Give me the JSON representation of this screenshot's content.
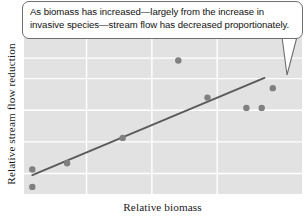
{
  "figure": {
    "callout": {
      "text": "As biomass has increased—largely from the increase in invasive species—stream flow has decreased proportionately."
    }
  },
  "chart_data": {
    "type": "scatter",
    "title": "",
    "xlabel": "Relative biomass",
    "ylabel": "Relative stream flow reduction",
    "xlim": [
      0,
      10
    ],
    "ylim": [
      0,
      10
    ],
    "grid": true,
    "legend": null,
    "colors": {
      "plot_background": "#e2e2e2",
      "gridline": "#ffffff",
      "point": "#808080",
      "trend_line": "#5a5a5a",
      "callout_border": "#6e6e6e",
      "callout_background": "#ffffff",
      "text": "#111111"
    },
    "x_gridlines": [
      2.25,
      4.6,
      6.95
    ],
    "y_gridlines": [
      1.3,
      3.3,
      5.3,
      7.3,
      8.6
    ],
    "points": [
      {
        "x": 0.3,
        "y": 1.55
      },
      {
        "x": 0.3,
        "y": 0.45
      },
      {
        "x": 1.55,
        "y": 1.95
      },
      {
        "x": 3.55,
        "y": 3.55
      },
      {
        "x": 5.55,
        "y": 8.45
      },
      {
        "x": 6.6,
        "y": 6.1
      },
      {
        "x": 8.0,
        "y": 5.45
      },
      {
        "x": 8.55,
        "y": 5.45
      },
      {
        "x": 8.95,
        "y": 6.7
      }
    ],
    "trend_line": {
      "x_start": 0.3,
      "y_start": 1.2,
      "x_end": 8.65,
      "y_end": 7.35
    }
  }
}
